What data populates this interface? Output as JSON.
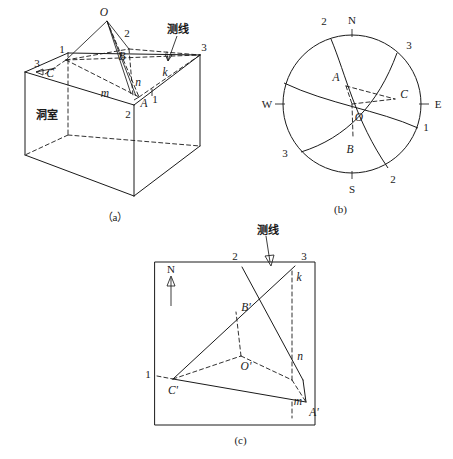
{
  "figure": {
    "title_present": false,
    "panels": [
      {
        "id": "a",
        "caption": "（a）",
        "type": "3d-block-diagram",
        "description": "Rectangular underground chamber block with projection point O above the roof and three joint traces",
        "labels": {
          "room": "洞室",
          "survey_line": "测线",
          "point_O": "O",
          "point_A": "A",
          "point_B": "B",
          "point_C": "C",
          "seg_k": "k",
          "seg_m": "m",
          "seg_n": "n",
          "num_1_left": "1",
          "num_1_right": "1",
          "num_2_top": "2",
          "num_2_bottom": "2",
          "num_3_left": "3",
          "num_3_right": "3"
        }
      },
      {
        "id": "b",
        "caption": "(b)",
        "type": "stereonet-projection",
        "description": "Equal-area stereographic projection circle with great-circle arcs for joint sets 1, 2 and 3",
        "labels": {
          "north": "N",
          "south": "S",
          "east": "E",
          "west": "W",
          "center_O": "O",
          "point_A": "A",
          "point_B": "B",
          "point_C": "C",
          "arc_2_top": "2",
          "arc_2_bottom": "2",
          "arc_3_top": "3",
          "arc_3_bottom": "3",
          "arc_1_right": "1"
        }
      },
      {
        "id": "c",
        "caption": "(c)",
        "type": "plan-map",
        "description": "Plan view inside a square frame showing traces 1, 2, 3, the survey line and projected points A', B', C', O'",
        "labels": {
          "north": "N",
          "survey_line": "测线",
          "point_A": "A'",
          "point_B": "B'",
          "point_C": "C'",
          "point_O": "O'",
          "seg_k": "k",
          "seg_m": "m",
          "seg_n": "n",
          "num_1": "1",
          "num_2": "2",
          "num_3": "3"
        }
      }
    ]
  },
  "style": {
    "stroke_color": "#1a1a1a",
    "background": "#ffffff"
  }
}
